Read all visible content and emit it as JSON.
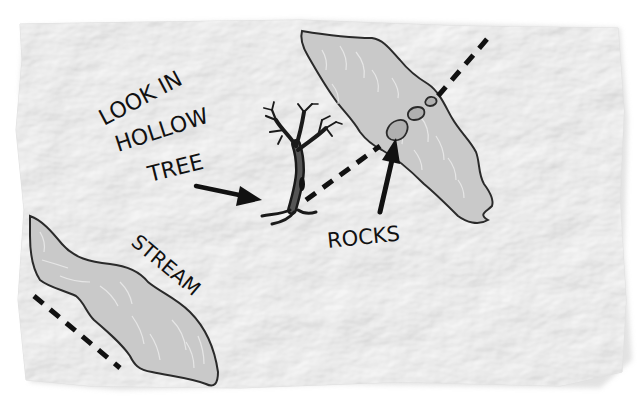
{
  "map": {
    "background": "#ffffff",
    "paper_color": "#f2f2f2",
    "water_fill": "#c9c9c9",
    "outline_color": "#2a2a2a",
    "path_color": "#111111",
    "labels": {
      "tree_line1": "LOOK IN",
      "tree_line2": "HOLLOW",
      "tree_line3": "TREE",
      "rocks": "ROCKS",
      "stream": "STREAM"
    },
    "features": [
      {
        "name": "hollow-tree",
        "icon": "dead-tree-icon"
      },
      {
        "name": "stepping-rocks",
        "icon": "rocks-icon",
        "count": 3
      },
      {
        "name": "upper-stream",
        "icon": "water-icon"
      },
      {
        "name": "lower-stream",
        "icon": "water-icon"
      }
    ]
  }
}
